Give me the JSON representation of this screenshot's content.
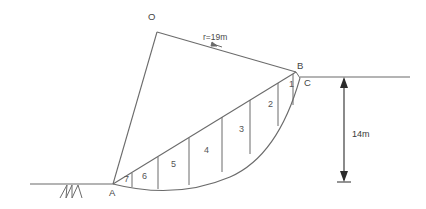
{
  "figure": {
    "type": "engineering-diagram",
    "background_color": "#ffffff",
    "line_color": "#6b6b6b",
    "arrow_color": "#2b2b2b",
    "text_color": "#3a3a3a"
  },
  "points": {
    "O": {
      "label": "O",
      "x": 157,
      "y": 32,
      "label_x": 148,
      "label_y": 12
    },
    "A": {
      "label": "A",
      "x": 113,
      "y": 184,
      "label_x": 109,
      "label_y": 188
    },
    "B": {
      "label": "B",
      "x": 296,
      "y": 72,
      "label_x": 297,
      "label_y": 61
    },
    "C": {
      "label": "C",
      "x": 300,
      "y": 78,
      "label_x": 304,
      "label_y": 78
    }
  },
  "annotations": {
    "radius": {
      "text": "r=19m",
      "x": 203,
      "y": 33
    },
    "height": {
      "text": "14m",
      "x": 352,
      "y": 130
    }
  },
  "slices": [
    {
      "label": "1",
      "x": 289,
      "y": 80
    },
    {
      "label": "2",
      "x": 268,
      "y": 100
    },
    {
      "label": "3",
      "x": 239,
      "y": 125
    },
    {
      "label": "4",
      "x": 204,
      "y": 146
    },
    {
      "label": "5",
      "x": 171,
      "y": 160
    },
    {
      "label": "6",
      "x": 142,
      "y": 172
    },
    {
      "label": "7",
      "x": 124,
      "y": 175
    }
  ],
  "geometry": {
    "ground_line_left": {
      "x1": 30,
      "y1": 184,
      "x2": 113,
      "y2": 184
    },
    "ground_line_right": {
      "x1": 300,
      "y1": 77,
      "x2": 410,
      "y2": 77
    },
    "slope_face": {
      "x1": 113,
      "y1": 184,
      "x2": 300,
      "y2": 77
    },
    "radius_OA": {
      "x1": 157,
      "y1": 32,
      "x2": 113,
      "y2": 184
    },
    "radius_OB": {
      "x1": 157,
      "y1": 32,
      "x2": 296,
      "y2": 72
    },
    "failure_arc": {
      "start_x": 113,
      "start_y": 184,
      "ctrl_x": 205,
      "ctrl_y": 205,
      "end_x": 300,
      "end_y": 78
    },
    "chord_AB": {
      "x1": 113,
      "y1": 184,
      "x2": 296,
      "y2": 72
    },
    "dimension_line": {
      "x": 344,
      "y_top": 77,
      "y_bottom": 182
    },
    "slice_dividers": [
      {
        "x_top": 296,
        "y_top": 72,
        "x_bottom": 293,
        "y_bottom": 97
      },
      {
        "x_top": 278,
        "y_top": 84,
        "x_bottom": 277,
        "y_bottom": 123
      },
      {
        "x_top": 250,
        "y_top": 101,
        "x_bottom": 250,
        "y_bottom": 150
      },
      {
        "x_top": 222,
        "y_top": 118,
        "x_bottom": 222,
        "y_bottom": 168
      },
      {
        "x_top": 189,
        "y_top": 138,
        "x_bottom": 189,
        "y_bottom": 183
      },
      {
        "x_top": 158,
        "y_top": 157,
        "x_bottom": 158,
        "y_bottom": 187
      },
      {
        "x_top": 132,
        "y_top": 172,
        "x_bottom": 132,
        "y_bottom": 186
      }
    ],
    "hatching": {
      "x_start": 58,
      "x_end": 82,
      "y_top": 185,
      "y_bottom": 198,
      "strokes": 6
    }
  }
}
